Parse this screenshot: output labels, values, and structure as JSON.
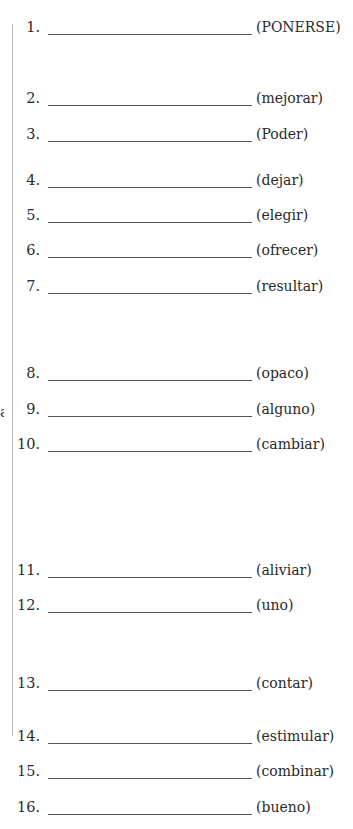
{
  "margin_fragment": "a",
  "rows": [
    {
      "number": "1.",
      "hint": "(PONERSE)",
      "top": 17
    },
    {
      "number": "2.",
      "hint": "(mejorar)",
      "top": 88
    },
    {
      "number": "3.",
      "hint": "(Poder)",
      "top": 124
    },
    {
      "number": "4.",
      "hint": "(dejar)",
      "top": 170
    },
    {
      "number": "5.",
      "hint": "(elegir)",
      "top": 205
    },
    {
      "number": "6.",
      "hint": "(ofrecer)",
      "top": 240
    },
    {
      "number": "7.",
      "hint": "(resultar)",
      "top": 276
    },
    {
      "number": "8.",
      "hint": "(opaco)",
      "top": 363
    },
    {
      "number": "9.",
      "hint": "(alguno)",
      "top": 399
    },
    {
      "number": "10.",
      "hint": "(cambiar)",
      "top": 434
    },
    {
      "number": "11.",
      "hint": "(aliviar)",
      "top": 560
    },
    {
      "number": "12.",
      "hint": "(uno)",
      "top": 595
    },
    {
      "number": "13.",
      "hint": "(contar)",
      "top": 673
    },
    {
      "number": "14.",
      "hint": "(estimular)",
      "top": 726
    },
    {
      "number": "15.",
      "hint": "(combinar)",
      "top": 761
    },
    {
      "number": "16.",
      "hint": "(bueno)",
      "top": 797
    }
  ]
}
